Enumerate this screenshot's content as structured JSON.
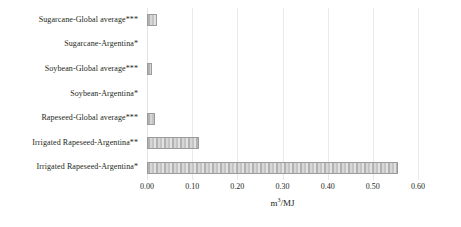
{
  "chart_data": {
    "type": "bar",
    "orientation": "horizontal",
    "title": "",
    "subtitle": "",
    "xlabel": "m³/MJ",
    "ylabel": "",
    "xlim": [
      0.0,
      0.6
    ],
    "xticks": [
      "0.00",
      "0.10",
      "0.20",
      "0.30",
      "0.40",
      "0.50",
      "0.60"
    ],
    "xtick_values": [
      0.0,
      0.1,
      0.2,
      0.3,
      0.4,
      0.5,
      0.6
    ],
    "grid": "vertical-only",
    "legend": "none",
    "categories": [
      "Sugarcane-Global average***",
      "Sugarcane-Argentina*",
      "Soybean-Global average***",
      "Soybean-Argentina*",
      "Rapeseed-Global average***",
      "Irrigated Rapeseed-Argentina**",
      "Irrigated Rapeseed-Argentina*"
    ],
    "values": [
      0.022,
      0.0,
      0.011,
      0.0,
      0.017,
      0.115,
      0.555
    ],
    "series": [
      {
        "name": "Water footprint",
        "values": [
          0.022,
          0.0,
          0.011,
          0.0,
          0.017,
          0.115,
          0.555
        ]
      }
    ],
    "bar_color": "#bdbdbd",
    "bar_edge_color": "#9b9b9b",
    "grid_color": "#e9e9ea",
    "text_color": "#231f20",
    "axis_title_unit": "m3/MJ"
  }
}
